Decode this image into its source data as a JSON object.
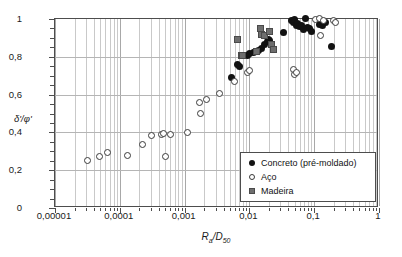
{
  "chart_data": {
    "type": "scatter",
    "title": "",
    "xlabel": "Ra/D50",
    "ylabel": "δ'/φ'",
    "xscale": "log",
    "xlim": [
      1e-05,
      1
    ],
    "ylim": [
      0,
      1
    ],
    "grid": true,
    "legend_position": "bottom-right",
    "x_tick_labels": [
      "0,00001",
      "0,0001",
      "0,001",
      "0,01",
      "0,1",
      "1"
    ],
    "x_tick_values": [
      1e-05,
      0.0001,
      0.001,
      0.01,
      0.1,
      1
    ],
    "y_tick_labels": [
      "0",
      "0,2",
      "0,4",
      "0,6",
      "0,8",
      "1"
    ],
    "y_tick_values": [
      0,
      0.2,
      0.4,
      0.6,
      0.8,
      1
    ],
    "series": [
      {
        "name": "Concreto (pré-moldado)",
        "marker": "filled-circle",
        "color": "#121212",
        "points": [
          [
            0.0055,
            0.683
          ],
          [
            0.0068,
            0.752
          ],
          [
            0.0072,
            0.745
          ],
          [
            0.0098,
            0.8
          ],
          [
            0.0105,
            0.812
          ],
          [
            0.0118,
            0.818
          ],
          [
            0.013,
            0.822
          ],
          [
            0.0142,
            0.828
          ],
          [
            0.016,
            0.84
          ],
          [
            0.018,
            0.862
          ],
          [
            0.0195,
            0.875
          ],
          [
            0.0205,
            0.888
          ],
          [
            0.0215,
            0.882
          ],
          [
            0.0345,
            0.925
          ],
          [
            0.047,
            0.988
          ],
          [
            0.05,
            0.975
          ],
          [
            0.052,
            0.99
          ],
          [
            0.0545,
            0.96
          ],
          [
            0.058,
            0.972
          ],
          [
            0.062,
            0.955
          ],
          [
            0.066,
            0.962
          ],
          [
            0.07,
            0.94
          ],
          [
            0.076,
            0.998
          ],
          [
            0.081,
            0.952
          ],
          [
            0.088,
            0.945
          ],
          [
            0.093,
            0.93
          ],
          [
            0.125,
            0.968
          ],
          [
            0.14,
            0.96
          ],
          [
            0.155,
            0.975
          ],
          [
            0.19,
            0.848
          ]
        ]
      },
      {
        "name": "Aço",
        "marker": "open-circle",
        "color": "#3a3a3a",
        "points": [
          [
            3.3e-05,
            0.248
          ],
          [
            5e-05,
            0.265
          ],
          [
            6.8e-05,
            0.288
          ],
          [
            0.000135,
            0.275
          ],
          [
            0.00023,
            0.333
          ],
          [
            0.00032,
            0.378
          ],
          [
            0.00045,
            0.382
          ],
          [
            0.00049,
            0.39
          ],
          [
            0.00052,
            0.268
          ],
          [
            0.00062,
            0.385
          ],
          [
            0.00115,
            0.393
          ],
          [
            0.00175,
            0.552
          ],
          [
            0.00185,
            0.497
          ],
          [
            0.00225,
            0.568
          ],
          [
            0.0036,
            0.598
          ],
          [
            0.006,
            0.663
          ],
          [
            0.0098,
            0.712
          ],
          [
            0.0105,
            0.722
          ],
          [
            0.05,
            0.728
          ],
          [
            0.052,
            0.7
          ],
          [
            0.0555,
            0.712
          ],
          [
            0.11,
            0.992
          ],
          [
            0.125,
            0.998
          ],
          [
            0.145,
            0.985
          ],
          [
            0.13,
            0.905
          ],
          [
            0.205,
            0.985
          ],
          [
            0.22,
            0.975
          ]
        ]
      },
      {
        "name": "Madeira",
        "marker": "filled-square",
        "color": "#6e6e6e",
        "points": [
          [
            0.0068,
            0.888
          ],
          [
            0.0078,
            0.802
          ],
          [
            0.0082,
            0.8
          ],
          [
            0.0132,
            0.825
          ],
          [
            0.0152,
            0.945
          ],
          [
            0.016,
            0.912
          ],
          [
            0.0175,
            0.905
          ],
          [
            0.021,
            0.928
          ],
          [
            0.0225,
            0.862
          ],
          [
            0.0245,
            0.832
          ]
        ]
      }
    ]
  },
  "legend": {
    "items": [
      {
        "label": "Concreto (pré-moldado)",
        "symbol": "filled-circle"
      },
      {
        "label": "Aço",
        "symbol": "open-circle"
      },
      {
        "label": "Madeira",
        "symbol": "filled-square"
      }
    ]
  },
  "axes": {
    "x_title_main": "R",
    "x_title_sub1": "a",
    "x_title_mid": "/D",
    "x_title_sub2": "50",
    "y_title": "δ'/φ'"
  }
}
